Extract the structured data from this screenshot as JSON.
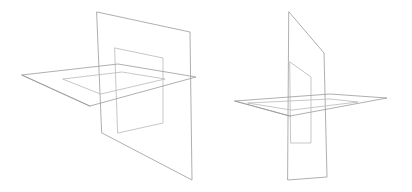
{
  "page": {
    "title": "Intersecting Planes Wireframe Illustration",
    "background_color": "#ffffff",
    "width": 412,
    "height": 192
  },
  "style": {
    "stroke_color": "#9a9a9a",
    "stroke_color_light": "#b9b9b9",
    "stroke_width": 0.8,
    "fill": "none"
  },
  "figures": [
    {
      "id": "figure-left",
      "label": "Left view: vertical plane with rectangular aperture intersecting a horizontal plane with rectangular aperture",
      "viewpoint": "three-quarter front-left",
      "parts": [
        {
          "name": "vertical-plane-outline",
          "type": "polygon",
          "closed": true,
          "points": [
            [
              97,
              12
            ],
            [
              190,
              32
            ],
            [
              192,
              180
            ],
            [
              102,
              133
            ]
          ]
        },
        {
          "name": "vertical-plane-aperture",
          "type": "polygon",
          "closed": true,
          "points": [
            [
              115,
              48
            ],
            [
              163,
              58
            ],
            [
              163,
              123
            ],
            [
              118,
              133
            ]
          ]
        },
        {
          "name": "horizontal-plane-outline",
          "type": "polygon",
          "closed": true,
          "points": [
            [
              22,
              75
            ],
            [
              118,
              64
            ],
            [
              196,
              77
            ],
            [
              90,
              106
            ]
          ]
        },
        {
          "name": "horizontal-plane-aperture",
          "type": "polygon",
          "closed": true,
          "points": [
            [
              63,
              79
            ],
            [
              122,
              72
            ],
            [
              165,
              79
            ],
            [
              101,
              94
            ]
          ]
        },
        {
          "name": "horizontal-plane-edge-thickness",
          "type": "polyline",
          "closed": false,
          "points": [
            [
              22,
              75
            ],
            [
              90,
              106
            ]
          ]
        }
      ]
    },
    {
      "id": "figure-right",
      "label": "Right view: same two intersecting apertured planes seen nearly edge-on",
      "viewpoint": "near edge-on right",
      "parts": [
        {
          "name": "vertical-plane-outline",
          "type": "polygon",
          "closed": true,
          "points": [
            [
              289,
              12
            ],
            [
              324,
              53
            ],
            [
              327,
              177
            ],
            [
              288,
              180
            ]
          ]
        },
        {
          "name": "vertical-plane-aperture",
          "type": "polygon",
          "closed": true,
          "points": [
            [
              290,
              62
            ],
            [
              311,
              77
            ],
            [
              311,
              143
            ],
            [
              291,
              143
            ]
          ]
        },
        {
          "name": "horizontal-plane-outline",
          "type": "polygon",
          "closed": true,
          "points": [
            [
              235,
              101
            ],
            [
              330,
              94
            ],
            [
              387,
              98
            ],
            [
              290,
              116
            ]
          ]
        },
        {
          "name": "horizontal-plane-aperture",
          "type": "polygon",
          "closed": true,
          "points": [
            [
              248,
              103
            ],
            [
              330,
              99
            ],
            [
              358,
              102
            ],
            [
              292,
              110
            ]
          ]
        },
        {
          "name": "horizontal-plane-edge-thickness",
          "type": "polyline",
          "closed": false,
          "points": [
            [
              235,
              101
            ],
            [
              290,
              116
            ]
          ]
        }
      ]
    }
  ]
}
